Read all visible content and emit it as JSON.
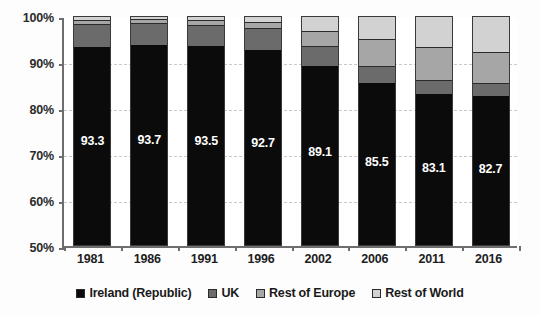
{
  "chart_data": {
    "type": "bar",
    "subtype": "stacked-percentage",
    "title": "",
    "xlabel": "",
    "ylabel": "",
    "ylim": [
      50,
      100
    ],
    "ytick_labels": [
      "100%",
      "90%",
      "80%",
      "70%",
      "60%",
      "50%"
    ],
    "ytick_values": [
      100,
      90,
      80,
      70,
      60,
      50
    ],
    "grid": true,
    "grid_style": "dashed-horizontal",
    "legend_position": "bottom",
    "categories": [
      "1981",
      "1986",
      "1991",
      "1996",
      "2002",
      "2006",
      "2011",
      "2016"
    ],
    "series": [
      {
        "name": "Ireland (Republic)",
        "color": "#0b0b0b",
        "values": [
          93.3,
          93.7,
          93.5,
          92.7,
          89.1,
          85.5,
          83.1,
          82.7
        ],
        "labels": [
          "93.3",
          "93.7",
          "93.5",
          "92.7",
          "89.1",
          "85.5",
          "83.1",
          "82.7"
        ]
      },
      {
        "name": "UK",
        "color": "#6b6b6b",
        "values": [
          5.0,
          4.8,
          4.6,
          4.8,
          4.3,
          3.6,
          3.1,
          2.7
        ]
      },
      {
        "name": "Rest of Europe",
        "color": "#a6a6a6",
        "values": [
          0.9,
          0.8,
          1.0,
          1.3,
          3.4,
          6.0,
          7.0,
          6.8
        ]
      },
      {
        "name": "Rest of World",
        "color": "#d2d2d2",
        "values": [
          0.8,
          0.7,
          0.9,
          1.2,
          3.2,
          4.9,
          6.8,
          7.8
        ]
      }
    ],
    "legend": [
      {
        "label": "Ireland (Republic)",
        "color": "#0b0b0b"
      },
      {
        "label": "UK",
        "color": "#6b6b6b"
      },
      {
        "label": "Rest of Europe",
        "color": "#a6a6a6"
      },
      {
        "label": "Rest of World",
        "color": "#d2d2d2"
      }
    ]
  }
}
